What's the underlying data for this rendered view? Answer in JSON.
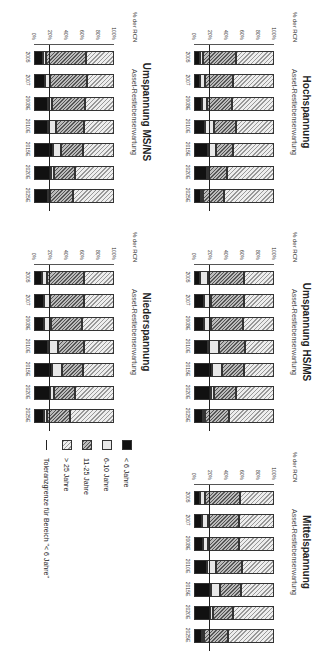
{
  "chart_data": [
    {
      "type": "bar",
      "stacked": true,
      "title": "Hochspannung",
      "subtitle": "Asset-Restlebenserwartung",
      "ylabel": "% der RCN",
      "ylim": [
        0,
        100
      ],
      "yticks": [
        "0%",
        "20%",
        "40%",
        "60%",
        "80%",
        "100%"
      ],
      "categories": [
        "2005",
        "2007",
        "2008E",
        "2010E",
        "2015E",
        "2020E",
        "2025E"
      ],
      "series": [
        {
          "name": "< 6 Jahre",
          "values": [
            7,
            8,
            10,
            14,
            17,
            16,
            9
          ]
        },
        {
          "name": "6-10 Jahre",
          "values": [
            4,
            6,
            6,
            11,
            11,
            3,
            2
          ]
        },
        {
          "name": "11-25 Jahre",
          "values": [
            41,
            35,
            32,
            27,
            21,
            22,
            26
          ]
        },
        {
          "name": "> 25 Jahre",
          "values": [
            48,
            51,
            52,
            48,
            51,
            59,
            63
          ]
        }
      ],
      "tolerance_line": 19
    },
    {
      "type": "bar",
      "stacked": true,
      "title": "Umspannung MS/NS",
      "subtitle": "Asset-Restlebenserwartung",
      "ylabel": "% der RCN",
      "ylim": [
        0,
        100
      ],
      "yticks": [
        "0%",
        "20%",
        "40%",
        "60%",
        "80%",
        "100%"
      ],
      "categories": [
        "2005",
        "2007",
        "2008E",
        "2010E",
        "2015E",
        "2020E",
        "2025E"
      ],
      "series": [
        {
          "name": "< 6 Jahre",
          "values": [
            11,
            14,
            17,
            17,
            24,
            21,
            18
          ]
        },
        {
          "name": "6-10 Jahre",
          "values": [
            4,
            6,
            5,
            11,
            10,
            4,
            2
          ]
        },
        {
          "name": "11-25 Jahre",
          "values": [
            50,
            46,
            42,
            35,
            27,
            26,
            29
          ]
        },
        {
          "name": "> 25 Jahre",
          "values": [
            35,
            34,
            36,
            37,
            39,
            49,
            51
          ]
        }
      ],
      "tolerance_line": 19
    },
    {
      "type": "bar",
      "stacked": true,
      "title": "Umspannung HS/MS",
      "subtitle": "Asset-Restlebenserwartung",
      "ylabel": "% der RCN",
      "ylim": [
        0,
        100
      ],
      "yticks": [
        "0%",
        "20%",
        "40%",
        "60%",
        "80%",
        "100%"
      ],
      "categories": [
        "2005",
        "2007",
        "2008E",
        "2010E",
        "2015E",
        "2020E",
        "2025E"
      ],
      "series": [
        {
          "name": "< 6 Jahre",
          "values": [
            8,
            12,
            13,
            18,
            23,
            21,
            11
          ]
        },
        {
          "name": "6-10 Jahre",
          "values": [
            9,
            9,
            8,
            13,
            12,
            4,
            3
          ]
        },
        {
          "name": "11-25 Jahre",
          "values": [
            45,
            41,
            40,
            33,
            28,
            27,
            30
          ]
        },
        {
          "name": "> 25 Jahre",
          "values": [
            38,
            38,
            39,
            36,
            37,
            48,
            56
          ]
        }
      ],
      "tolerance_line": 19
    },
    {
      "type": "bar",
      "stacked": true,
      "title": "Niederspannung",
      "subtitle": "Asset-Restlebenserwartung",
      "ylabel": "% der RCN",
      "ylim": [
        0,
        100
      ],
      "yticks": [
        "0%",
        "20%",
        "40%",
        "60%",
        "80%",
        "100%"
      ],
      "categories": [
        "2005",
        "2007",
        "2008E",
        "2010E",
        "2015E",
        "2020E",
        "2025E"
      ],
      "series": [
        {
          "name": "< 6 Jahre",
          "values": [
            10,
            12,
            13,
            17,
            22,
            20,
            13
          ]
        },
        {
          "name": "6-10 Jahre",
          "values": [
            6,
            8,
            8,
            13,
            13,
            5,
            3
          ]
        },
        {
          "name": "11-25 Jahre",
          "values": [
            46,
            42,
            39,
            32,
            26,
            26,
            29
          ]
        },
        {
          "name": "> 25 Jahre",
          "values": [
            38,
            38,
            40,
            38,
            39,
            49,
            55
          ]
        }
      ],
      "tolerance_line": 19
    },
    {
      "type": "bar",
      "stacked": true,
      "title": "Mittelspannung",
      "subtitle": "Asset-Restlebenserwartung",
      "ylabel": "% der RCN",
      "ylim": [
        0,
        100
      ],
      "yticks": [
        "0%",
        "20%",
        "40%",
        "60%",
        "80%",
        "100%"
      ],
      "categories": [
        "2005",
        "2007",
        "2008E",
        "2010E",
        "2015E",
        "2020E",
        "2025E"
      ],
      "series": [
        {
          "name": "< 6 Jahre",
          "values": [
            8,
            10,
            11,
            16,
            21,
            20,
            10
          ]
        },
        {
          "name": "6-10 Jahre",
          "values": [
            6,
            7,
            7,
            12,
            12,
            4,
            3
          ]
        },
        {
          "name": "11-25 Jahre",
          "values": [
            44,
            39,
            38,
            32,
            26,
            25,
            29
          ]
        },
        {
          "name": "> 25 Jahre",
          "values": [
            42,
            44,
            44,
            40,
            41,
            51,
            58
          ]
        }
      ],
      "tolerance_line": 19
    }
  ],
  "legend": {
    "items": [
      {
        "label": "< 6 Jahre"
      },
      {
        "label": "6-10 Jahre"
      },
      {
        "label": "11-25 Jahre"
      },
      {
        "label": "> 25 Jahre"
      },
      {
        "label": "Toleranzgrenze für Bereich \"< 6 Jahre\""
      }
    ]
  },
  "colors": {
    "lt6": "#111111",
    "6_10": "#e8e8e8",
    "11_25": "#777777",
    "gt25": "#cccccc"
  }
}
